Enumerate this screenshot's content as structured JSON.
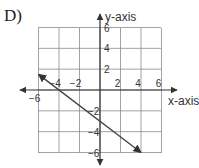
{
  "problem_label": "D)",
  "chart_data": {
    "type": "line",
    "title": "",
    "xlabel": "x-axis",
    "ylabel": "y-axis",
    "xlim": [
      -6,
      6
    ],
    "ylim": [
      -6,
      6
    ],
    "grid": true,
    "grid_step": 2,
    "x_ticks": [
      -6,
      -4,
      -2,
      2,
      4,
      6
    ],
    "y_ticks": [
      6,
      4,
      2,
      -2,
      -4,
      -6
    ],
    "x_tick_labels": [
      "−6",
      "−4",
      "−2",
      "2",
      "4",
      "6"
    ],
    "y_tick_labels": [
      "6",
      "4",
      "2",
      "−2",
      "−4",
      "−6"
    ],
    "series": [
      {
        "name": "line",
        "points": [
          [
            -6,
            1.5
          ],
          [
            4,
            -6
          ]
        ],
        "arrows": "both",
        "equation": "y = -0.75x - 3"
      }
    ]
  },
  "colors": {
    "grid": "#8a8a8a",
    "axis": "#333333",
    "line": "#444444"
  }
}
